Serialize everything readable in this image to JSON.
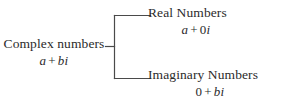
{
  "diagram": {
    "type": "classification-tree",
    "orientation": "left-to-right",
    "background_color": "#ffffff",
    "text_color": "#2b2b2b",
    "line_color": "#4a4a4a",
    "root": {
      "title": "Complex numbers",
      "expression": {
        "full": "a + bi",
        "terms": [
          {
            "text": "a",
            "style": "italic"
          },
          {
            "text": "+",
            "style": "upright"
          },
          {
            "text": "b",
            "style": "italic"
          },
          {
            "text": "i",
            "style": "italic"
          }
        ]
      }
    },
    "branches": [
      {
        "id": "real",
        "title": "Real Numbers",
        "expression": {
          "full": "a + 0i",
          "terms": [
            {
              "text": "a",
              "style": "italic"
            },
            {
              "text": "+",
              "style": "upright"
            },
            {
              "text": "0",
              "style": "upright"
            },
            {
              "text": "i",
              "style": "italic"
            }
          ]
        }
      },
      {
        "id": "imaginary",
        "title": "Imaginary Numbers",
        "expression": {
          "full": "0 + bi",
          "terms": [
            {
              "text": "0",
              "style": "upright"
            },
            {
              "text": "+",
              "style": "upright"
            },
            {
              "text": "b",
              "style": "italic"
            },
            {
              "text": "i",
              "style": "italic"
            }
          ]
        }
      }
    ]
  }
}
